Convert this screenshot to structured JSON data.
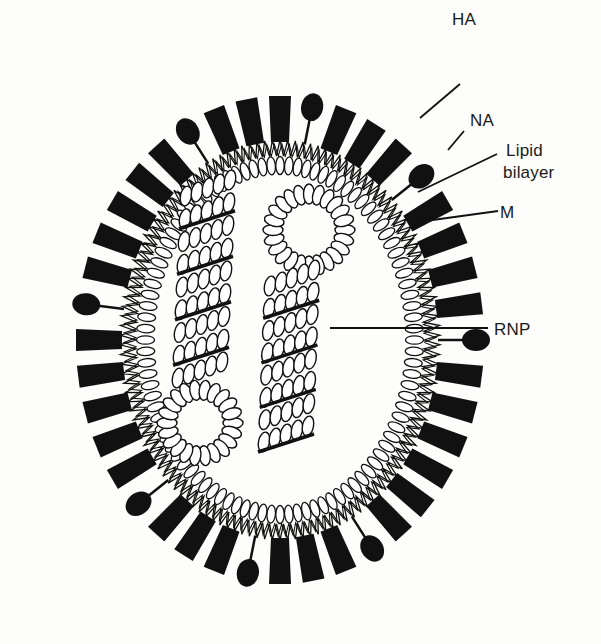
{
  "diagram": {
    "colors": {
      "background": "#fdfdfb",
      "ink": "#111111",
      "fill_light": "#ffffff"
    },
    "virion": {
      "center": [
        280,
        340
      ],
      "inner_radius": [
        125,
        165
      ],
      "membrane_radius": [
        140,
        180
      ],
      "spike_base_radius": [
        158,
        198
      ]
    },
    "spikes_pattern": [
      "HA",
      "NA",
      "HA",
      "HA",
      "HA",
      "NA",
      "HA",
      "HA",
      "HA",
      "HA",
      "NA",
      "HA",
      "HA",
      "HA",
      "HA",
      "HA",
      "HA",
      "NA",
      "HA",
      "HA",
      "HA",
      "NA",
      "HA",
      "HA",
      "HA",
      "NA",
      "HA",
      "HA",
      "HA",
      "HA",
      "HA",
      "NA",
      "HA",
      "HA",
      "HA",
      "HA",
      "HA",
      "NA",
      "HA",
      "HA"
    ],
    "labels": [
      {
        "id": "HA",
        "text": "HA",
        "x": 462,
        "y": 8,
        "line": [
          [
            420,
            118
          ],
          [
            460,
            84
          ]
        ]
      },
      {
        "id": "NA",
        "text": "NA",
        "x": 470,
        "y": 110,
        "line": [
          [
            448,
            150
          ],
          [
            464,
            131
          ]
        ]
      },
      {
        "id": "lipid",
        "text": "Lipid",
        "x": 506,
        "y": 141,
        "line": [
          [
            418,
            192
          ],
          [
            497,
            154
          ]
        ]
      },
      {
        "id": "lipid2",
        "text": "bilayer",
        "x": 500,
        "y": 163
      },
      {
        "id": "M",
        "text": "M",
        "x": 500,
        "y": 205,
        "line": [
          [
            418,
            222
          ],
          [
            498,
            211
          ]
        ]
      },
      {
        "id": "RNP",
        "text": "RNP",
        "x": 492,
        "y": 313,
        "line": [
          [
            330,
            328
          ],
          [
            488,
            328
          ]
        ]
      }
    ]
  }
}
